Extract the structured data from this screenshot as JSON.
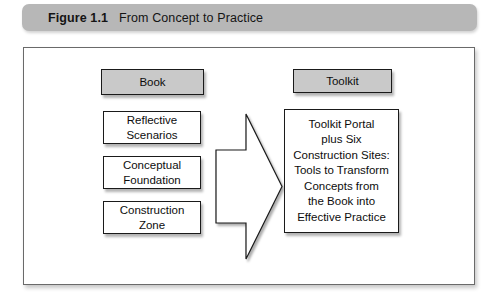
{
  "caption": {
    "label": "Figure 1.1",
    "title": "From Concept to Practice"
  },
  "colors": {
    "caption_bar": "#b7b7b7",
    "shaded_node": "#c9c9c9",
    "node_border": "#1a1a1a",
    "frame_border": "#6a6a6a",
    "page_background": "#ffffff",
    "text": "#0d0d0d"
  },
  "diagram": {
    "type": "flow",
    "columns": [
      {
        "header": "Book",
        "header_style": "shaded",
        "items": [
          "Reflective\nScenarios",
          "Conceptual\nFoundation",
          "Construction\nZone"
        ]
      },
      {
        "header": "Toolkit",
        "header_style": "shaded",
        "items": [
          "Toolkit Portal\nplus Six\nConstruction Sites:\nTools to Transform\nConcepts from\nthe Book into\nEffective Practice"
        ]
      }
    ],
    "connector": {
      "kind": "block-arrow",
      "direction": "right",
      "from": "Book",
      "to": "Toolkit"
    },
    "nodes": {
      "book": "Book",
      "toolkit": "Toolkit",
      "reflective_scenarios": "Reflective\nScenarios",
      "conceptual_foundation": "Conceptual\nFoundation",
      "construction_zone": "Construction\nZone",
      "outcome": "Toolkit Portal\nplus Six\nConstruction Sites:\nTools to Transform\nConcepts from\nthe Book into\nEffective Practice"
    }
  }
}
